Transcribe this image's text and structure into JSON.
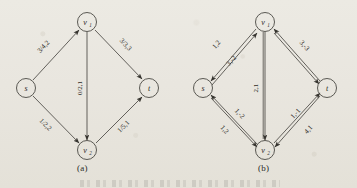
{
  "figure": {
    "caption_a": "(a)",
    "caption_b": "(b)",
    "node_labels": {
      "s": "s",
      "v1": "v",
      "v1_sub": "1",
      "v2": "v",
      "v2_sub": "2",
      "t": "t"
    }
  },
  "diagram_a": {
    "caption": "(a)",
    "type": "flow-network",
    "nodes": [
      {
        "id": "s",
        "label": "s",
        "x": 26,
        "y": 88
      },
      {
        "id": "v1",
        "label": "v1",
        "x": 87,
        "y": 22
      },
      {
        "id": "v2",
        "label": "v2",
        "x": 87,
        "y": 150
      },
      {
        "id": "t",
        "label": "t",
        "x": 149,
        "y": 88
      }
    ],
    "edges": [
      {
        "from": "s",
        "to": "v1",
        "label": "3/4,2"
      },
      {
        "from": "v1",
        "to": "t",
        "label": "3/3,3"
      },
      {
        "from": "v1",
        "to": "v2",
        "label": "0/2,1"
      },
      {
        "from": "s",
        "to": "v2",
        "label": "1/2,2"
      },
      {
        "from": "v2",
        "to": "t",
        "label": "1/5,1"
      }
    ]
  },
  "diagram_b": {
    "caption": "(b)",
    "type": "residual-network",
    "nodes": [
      {
        "id": "s",
        "label": "s",
        "x": 203,
        "y": 88
      },
      {
        "id": "v1",
        "label": "v1",
        "x": 265,
        "y": 22
      },
      {
        "id": "v2",
        "label": "v2",
        "x": 265,
        "y": 150
      },
      {
        "id": "t",
        "label": "t",
        "x": 327,
        "y": 88
      }
    ],
    "edges": [
      {
        "from": "s",
        "to": "v1",
        "label": "1,2"
      },
      {
        "from": "v1",
        "to": "s",
        "label": "3,-2"
      },
      {
        "from": "v1",
        "to": "t",
        "label": "3,-3"
      },
      {
        "from": "v1",
        "to": "v2",
        "label": "2,1"
      },
      {
        "from": "v2",
        "to": "s",
        "label": "1,-2"
      },
      {
        "from": "s",
        "to": "v2",
        "label": "1,2"
      },
      {
        "from": "t",
        "to": "v2",
        "label": "1,-1"
      },
      {
        "from": "v2",
        "to": "t",
        "label": "4,1"
      }
    ]
  },
  "labels": {
    "a_s_v1": "3/4,2",
    "a_v1_t": "3/3,3",
    "a_v1_v2": "0/2,1",
    "a_s_v2": "1/2,2",
    "a_v2_t": "1/5,1",
    "b_s_v1": "1,2",
    "b_v1_s": "3,-2",
    "b_v1_t": "3,-3",
    "b_v1_v2": "2,1",
    "b_v2_s": "1,-2",
    "b_s_v2": "1,2",
    "b_t_v2": "1,-1",
    "b_v2_t": "4,1"
  },
  "colors": {
    "ink": "#3a3833",
    "paper": "#e8e5de"
  }
}
